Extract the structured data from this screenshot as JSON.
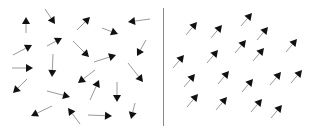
{
  "diagram": {
    "colors": {
      "background": "#ffffff",
      "arrow_head": "#111111",
      "arrow_shaft": "#9a9a9a",
      "divider": "#8a8a8a"
    },
    "divider": {
      "x": 163,
      "y1": 8,
      "y2": 126
    },
    "panels": [
      {
        "name": "random-panel",
        "arrows": [
          {
            "x1": 26,
            "y1": 33,
            "x2": 26,
            "y2": 17
          },
          {
            "x1": 45,
            "y1": 9,
            "x2": 55,
            "y2": 24
          },
          {
            "x1": 77,
            "y1": 30,
            "x2": 90,
            "y2": 17
          },
          {
            "x1": 102,
            "y1": 28,
            "x2": 118,
            "y2": 34
          },
          {
            "x1": 150,
            "y1": 19,
            "x2": 128,
            "y2": 22
          },
          {
            "x1": 13,
            "y1": 55,
            "x2": 32,
            "y2": 45
          },
          {
            "x1": 47,
            "y1": 46,
            "x2": 62,
            "y2": 38
          },
          {
            "x1": 73,
            "y1": 41,
            "x2": 89,
            "y2": 57
          },
          {
            "x1": 146,
            "y1": 40,
            "x2": 137,
            "y2": 56
          },
          {
            "x1": 94,
            "y1": 62,
            "x2": 116,
            "y2": 55
          },
          {
            "x1": 12,
            "y1": 68,
            "x2": 33,
            "y2": 68
          },
          {
            "x1": 53,
            "y1": 54,
            "x2": 52,
            "y2": 77
          },
          {
            "x1": 128,
            "y1": 63,
            "x2": 143,
            "y2": 82
          },
          {
            "x1": 95,
            "y1": 70,
            "x2": 78,
            "y2": 83
          },
          {
            "x1": 27,
            "y1": 79,
            "x2": 13,
            "y2": 93
          },
          {
            "x1": 90,
            "y1": 100,
            "x2": 99,
            "y2": 80
          },
          {
            "x1": 117,
            "y1": 82,
            "x2": 117,
            "y2": 102
          },
          {
            "x1": 47,
            "y1": 91,
            "x2": 70,
            "y2": 97
          },
          {
            "x1": 52,
            "y1": 106,
            "x2": 31,
            "y2": 116
          },
          {
            "x1": 80,
            "y1": 124,
            "x2": 68,
            "y2": 108
          },
          {
            "x1": 88,
            "y1": 115,
            "x2": 112,
            "y2": 116
          },
          {
            "x1": 135,
            "y1": 103,
            "x2": 131,
            "y2": 119
          }
        ]
      },
      {
        "name": "aligned-panel",
        "arrows": [
          {
            "x1": 186,
            "y1": 35,
            "x2": 197,
            "y2": 22
          },
          {
            "x1": 211,
            "y1": 38,
            "x2": 222,
            "y2": 25
          },
          {
            "x1": 241,
            "y1": 26,
            "x2": 252,
            "y2": 13
          },
          {
            "x1": 257,
            "y1": 40,
            "x2": 268,
            "y2": 27
          },
          {
            "x1": 286,
            "y1": 52,
            "x2": 297,
            "y2": 39
          },
          {
            "x1": 235,
            "y1": 53,
            "x2": 246,
            "y2": 40
          },
          {
            "x1": 207,
            "y1": 63,
            "x2": 218,
            "y2": 50
          },
          {
            "x1": 253,
            "y1": 61,
            "x2": 264,
            "y2": 48
          },
          {
            "x1": 173,
            "y1": 68,
            "x2": 184,
            "y2": 55
          },
          {
            "x1": 218,
            "y1": 84,
            "x2": 229,
            "y2": 71
          },
          {
            "x1": 184,
            "y1": 87,
            "x2": 195,
            "y2": 74
          },
          {
            "x1": 242,
            "y1": 92,
            "x2": 253,
            "y2": 79
          },
          {
            "x1": 270,
            "y1": 85,
            "x2": 281,
            "y2": 72
          },
          {
            "x1": 291,
            "y1": 83,
            "x2": 302,
            "y2": 70
          },
          {
            "x1": 187,
            "y1": 107,
            "x2": 198,
            "y2": 94
          },
          {
            "x1": 216,
            "y1": 110,
            "x2": 227,
            "y2": 97
          },
          {
            "x1": 251,
            "y1": 112,
            "x2": 262,
            "y2": 99
          },
          {
            "x1": 271,
            "y1": 118,
            "x2": 282,
            "y2": 105
          }
        ]
      }
    ]
  }
}
